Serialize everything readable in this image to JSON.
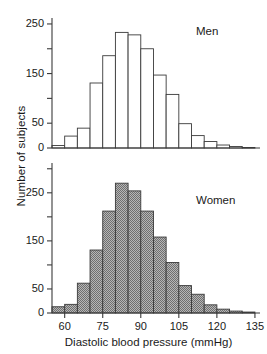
{
  "figure": {
    "ylabel": "Number of subjects",
    "xlabel": "Diastolic blood pressure (mmHg)",
    "axis_color": "#3a3a3a",
    "men_fill": "#ffffff",
    "women_fill": "#9a9a9a"
  },
  "men": {
    "label": "Men",
    "yticks_major": [
      "0",
      "50",
      "150",
      "250"
    ],
    "yticks_minor": [
      "100",
      "200"
    ]
  },
  "women": {
    "label": "Women",
    "yticks_major": [
      "0",
      "50",
      "150",
      "250"
    ],
    "yticks_minor": [
      "100",
      "200",
      "300"
    ]
  },
  "xticks": [
    "60",
    "75",
    "90",
    "105",
    "120",
    "135"
  ],
  "chart_data": [
    {
      "type": "bar",
      "title": "Men",
      "xlabel": "Diastolic blood pressure (mmHg)",
      "ylabel": "Number of subjects",
      "bin_width": 5,
      "xlim": [
        55,
        137
      ],
      "ylim": [
        0,
        260
      ],
      "grid": false,
      "legend": "none",
      "bin_starts": [
        55,
        60,
        65,
        70,
        75,
        80,
        85,
        90,
        95,
        100,
        105,
        110,
        115,
        120,
        125,
        130
      ],
      "categories": [
        "55-60",
        "60-65",
        "65-70",
        "70-75",
        "75-80",
        "80-85",
        "85-90",
        "90-95",
        "95-100",
        "100-105",
        "105-110",
        "110-115",
        "115-120",
        "120-125",
        "125-130",
        "130-135"
      ],
      "values": [
        5,
        24,
        40,
        131,
        186,
        233,
        228,
        200,
        147,
        108,
        49,
        25,
        13,
        6,
        3,
        1
      ]
    },
    {
      "type": "bar",
      "title": "Women",
      "xlabel": "Diastolic blood pressure (mmHg)",
      "ylabel": "Number of subjects",
      "bin_width": 5,
      "xlim": [
        55,
        137
      ],
      "ylim": [
        0,
        310
      ],
      "grid": false,
      "legend": "none",
      "bin_starts": [
        55,
        60,
        65,
        70,
        75,
        80,
        85,
        90,
        95,
        100,
        105,
        110,
        115,
        120,
        125,
        130
      ],
      "categories": [
        "55-60",
        "60-65",
        "65-70",
        "70-75",
        "75-80",
        "80-85",
        "85-90",
        "90-95",
        "95-100",
        "100-105",
        "105-110",
        "110-115",
        "115-120",
        "120-125",
        "125-130",
        "130-135"
      ],
      "values": [
        13,
        18,
        62,
        131,
        212,
        270,
        254,
        212,
        158,
        105,
        57,
        39,
        17,
        8,
        4,
        2
      ]
    }
  ]
}
